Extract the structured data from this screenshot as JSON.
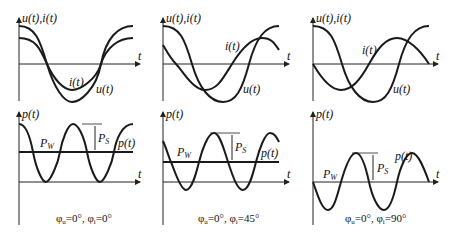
{
  "figure": {
    "panels": [
      {
        "id": "phase-0",
        "top_chart": {
          "ylabel": "u(t),i(t)",
          "xlabel": "t",
          "curves": [
            "u(t)",
            "i(t)"
          ]
        },
        "bottom_chart": {
          "ylabel": "p(t)",
          "xlabel": "t",
          "curve": "p(t)",
          "mean_label": "P_W",
          "amplitude_label": "P_S"
        },
        "caption": "φu=0°, φi=0°"
      },
      {
        "id": "phase-45",
        "top_chart": {
          "ylabel": "u(t),i(t)",
          "xlabel": "t",
          "curves": [
            "u(t)",
            "i(t)"
          ]
        },
        "bottom_chart": {
          "ylabel": "p(t)",
          "xlabel": "t",
          "curve": "p(t)",
          "mean_label": "P_W",
          "amplitude_label": "P_S"
        },
        "caption": "φu=0°, φi=45°"
      },
      {
        "id": "phase-90",
        "top_chart": {
          "ylabel": "u(t),i(t)",
          "xlabel": "t",
          "curves": [
            "u(t)",
            "i(t)"
          ]
        },
        "bottom_chart": {
          "ylabel": "p(t)",
          "xlabel": "t",
          "curve": "p(t)",
          "mean_label": "P_W",
          "amplitude_label": "P_S"
        },
        "caption": "φu=0°, φi=90°"
      }
    ]
  },
  "labels": {
    "u": "u(t)",
    "i": "i(t)",
    "p": "p(t)",
    "t": "t",
    "uiAxis": "u(t),i(t)",
    "pw": "P",
    "pw_sub": "W",
    "ps": "P",
    "ps_sub": "S"
  },
  "captions": {
    "c0": "φ",
    "c0_u": "u",
    "c0_rest1": "=0°, φ",
    "c0_i": "i",
    "c0_rest2": "=0°",
    "c1_rest2": "=45°",
    "c2_rest2": "=90°"
  }
}
